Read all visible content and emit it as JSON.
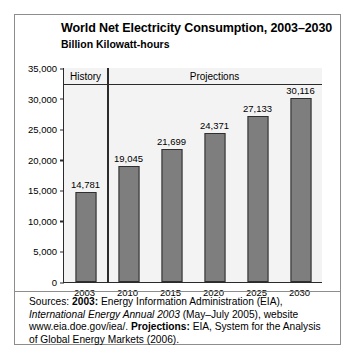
{
  "figure": {
    "title": "World Net Electricity Consumption, 2003–2030",
    "subtitle": "Billion Kilowatt-hours",
    "border_color": "#8d8d8d",
    "plot_background": "#f3f3f3",
    "axis_color": "#2b2b2b",
    "bar_fill": "#7e7e7e",
    "bar_outline": "#2f2f2f"
  },
  "source_note": {
    "label": "Sources:",
    "history_key": "2003:",
    "history_text": "Energy Information Administration (EIA),",
    "publication": "International Energy Annual 2003",
    "publication_detail": "(May–July 2005), website www.eia.doe.gov/iea/.",
    "projections_key": "Projections:",
    "projections_text": "EIA, System for the Analysis of Global Energy Markets (2006)."
  },
  "chart_data": {
    "type": "bar",
    "title": "World Net Electricity Consumption, 2003–2030",
    "subtitle": "Billion Kilowatt-hours",
    "xlabel": "",
    "ylabel": "Billion Kilowatt-hours",
    "categories": [
      "2003",
      "2010",
      "2015",
      "2020",
      "2025",
      "2030"
    ],
    "values": [
      14781,
      19045,
      21699,
      24371,
      27133,
      30116
    ],
    "value_labels": [
      "14,781",
      "19,045",
      "21,699",
      "24,371",
      "27,133",
      "30,116"
    ],
    "ylim": [
      0,
      35000
    ],
    "ytick_values": [
      0,
      5000,
      10000,
      15000,
      20000,
      25000,
      30000,
      35000
    ],
    "ytick_labels": [
      "0",
      "5,000",
      "10,000",
      "15,000",
      "20,000",
      "25,000",
      "30,000",
      "35,000"
    ],
    "grid": false,
    "legend_position": "none",
    "bands": [
      {
        "label": "History",
        "categories": [
          "2003"
        ]
      },
      {
        "label": "Projections",
        "categories": [
          "2010",
          "2015",
          "2020",
          "2025",
          "2030"
        ]
      }
    ],
    "annotations": [
      "History",
      "Projections"
    ]
  }
}
